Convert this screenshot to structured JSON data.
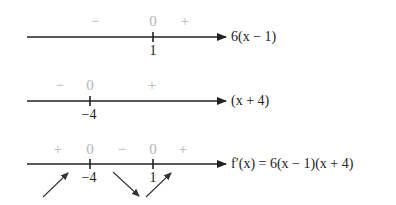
{
  "rows": [
    {
      "expression": "6(x − 1)",
      "critical_points": [
        {
          "label": "1",
          "x": 153
        }
      ],
      "signs": [
        {
          "glyph": "−",
          "x": 95
        },
        {
          "glyph": "0",
          "x": 153
        },
        {
          "glyph": "+",
          "x": 185
        }
      ],
      "line_y": 37
    },
    {
      "expression": "(x + 4)",
      "critical_points": [
        {
          "label": "−4",
          "x": 90
        }
      ],
      "signs": [
        {
          "glyph": "−",
          "x": 60
        },
        {
          "glyph": "0",
          "x": 90
        },
        {
          "glyph": "+",
          "x": 152
        }
      ],
      "line_y": 101
    },
    {
      "expression": "f′(x) = 6(x − 1)(x + 4)",
      "critical_points": [
        {
          "label": "−4",
          "x": 90
        },
        {
          "label": "1",
          "x": 153
        }
      ],
      "signs": [
        {
          "glyph": "+",
          "x": 58
        },
        {
          "glyph": "0",
          "x": 90
        },
        {
          "glyph": "−",
          "x": 122
        },
        {
          "glyph": "0",
          "x": 153
        },
        {
          "glyph": "+",
          "x": 183
        }
      ],
      "line_y": 164,
      "trend_arrows": [
        "increasing",
        "decreasing",
        "increasing"
      ]
    }
  ],
  "labels": {
    "r0_expr": "6(x − 1)",
    "r1_expr": "(x + 4)",
    "r2_expr": "f′(x) = 6(x − 1)(x + 4)",
    "r0_s0": "−",
    "r0_s1": "0",
    "r0_s2": "+",
    "r0_t0": "1",
    "r1_s0": "−",
    "r1_s1": "0",
    "r1_s2": "+",
    "r1_t0": "−4",
    "r2_s0": "+",
    "r2_s1": "0",
    "r2_s2": "−",
    "r2_s3": "0",
    "r2_s4": "+",
    "r2_t0": "−4",
    "r2_t1": "1"
  },
  "colors": {
    "line": "#222222",
    "sign": "#b4b4b4",
    "text": "#222222"
  }
}
